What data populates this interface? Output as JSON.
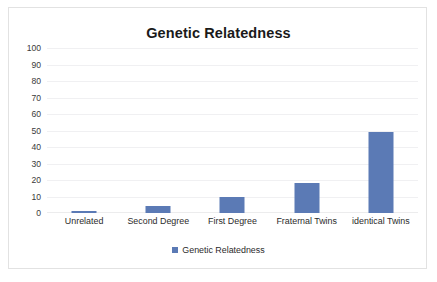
{
  "chart_data": {
    "type": "bar",
    "title": "Genetic Relatedness",
    "xlabel": "",
    "ylabel": "",
    "categories": [
      "Unrelated",
      "Second Degree",
      "First Degree",
      "Fraternal Twins",
      "identical Twins"
    ],
    "values": [
      1,
      4,
      9.5,
      18,
      49
    ],
    "series": [
      {
        "name": "Genetic Relatedness",
        "values": [
          1,
          4,
          9.5,
          18,
          49
        ],
        "color": "#5b7ab5"
      }
    ],
    "ylim": [
      0,
      100
    ],
    "ytick_step": 10,
    "ytick_labels": [
      "100",
      "90",
      "80",
      "70",
      "60",
      "50",
      "40",
      "30",
      "20",
      "10",
      "0"
    ],
    "grid": true,
    "grid_axis": "y",
    "legend": {
      "position": "bottom",
      "entries": [
        {
          "label": "Genetic Relatedness",
          "color": "#5b7ab5",
          "marker": "square"
        }
      ]
    },
    "colors": {
      "bar": "#5b7ab5",
      "gridline": "#f0f0f2",
      "border": "#e2e2e2",
      "background": "#ffffff",
      "text": "#2b2b2b",
      "title": "#1a1a1a"
    }
  }
}
